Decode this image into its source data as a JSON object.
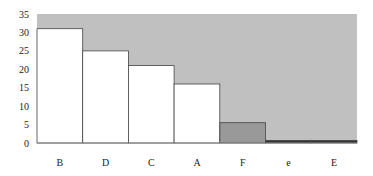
{
  "chart_data": {
    "type": "bar",
    "title": "",
    "xlabel": "",
    "ylabel": "",
    "categories": [
      "B",
      "D",
      "C",
      "A",
      "F",
      "e",
      "E"
    ],
    "values": [
      31,
      25,
      21,
      16,
      5.5,
      0.7,
      0.7
    ],
    "bar_colors": [
      "#ffffff",
      "#ffffff",
      "#ffffff",
      "#ffffff",
      "#999999",
      "#333333",
      "#333333"
    ],
    "ylim": [
      0,
      35
    ],
    "yticks": [
      0,
      5,
      10,
      15,
      20,
      25,
      30,
      35
    ],
    "grid": false,
    "legend": null,
    "plot_background": "#c0c0c0"
  }
}
